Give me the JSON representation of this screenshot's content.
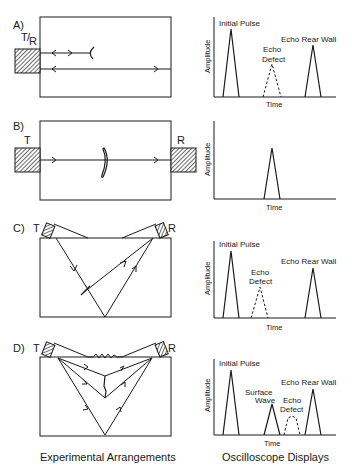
{
  "figure": {
    "captions": {
      "left": "Experimental Arrangements",
      "right": "Oscilloscope Displays"
    },
    "panels": [
      {
        "id": "A",
        "label": "A)",
        "transducers": [
          "T/R"
        ],
        "transducer_t": "T",
        "transducer_r": "R",
        "scope": {
          "ylabel": "Amplitude",
          "xlabel": "Time",
          "peaks": [
            {
              "label": "Initial Pulse",
              "style": "solid"
            },
            {
              "label_line1": "Echo",
              "label_line2": "Defect",
              "style": "dashed"
            },
            {
              "label": "Echo Rear Wall",
              "style": "solid"
            }
          ]
        }
      },
      {
        "id": "B",
        "label": "B)",
        "transducers": [
          "T",
          "R"
        ],
        "scope": {
          "ylabel": "Amplitude",
          "xlabel": "Time",
          "peaks": [
            {
              "label": "",
              "style": "solid"
            }
          ]
        }
      },
      {
        "id": "C",
        "label": "C)",
        "transducers": [
          "T",
          "R"
        ],
        "scope": {
          "ylabel": "Amplitude",
          "xlabel": "Time",
          "peaks": [
            {
              "label": "Initial Pulse",
              "style": "solid"
            },
            {
              "label_line1": "Echo",
              "label_line2": "Defect",
              "style": "dashed"
            },
            {
              "label": "Echo Rear Wall",
              "style": "solid"
            }
          ]
        }
      },
      {
        "id": "D",
        "label": "D)",
        "transducers": [
          "T",
          "R"
        ],
        "scope": {
          "ylabel": "Amplitude",
          "xlabel": "Time",
          "peaks": [
            {
              "label": "Initial Pulse",
              "style": "solid"
            },
            {
              "label_line1": "Surface",
              "label_line2": "Wave",
              "style": "solid"
            },
            {
              "label_line1": "Echo",
              "label_line2": "Defect",
              "style": "dashed"
            },
            {
              "label": "Echo Rear Wall",
              "style": "solid"
            }
          ]
        }
      }
    ]
  }
}
